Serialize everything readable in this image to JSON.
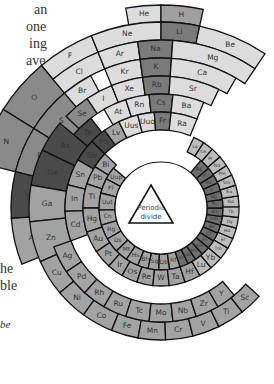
{
  "figure": {
    "center_label_line1": "Periodic",
    "center_label_line2": "divide",
    "center": {
      "x": 161,
      "y": 208
    },
    "colors": {
      "light": "#dcdcdc",
      "mid_light": "#c4c4c4",
      "mid": "#a3a3a3",
      "dark_mid": "#8a8a8a",
      "alkali": "#7a7a7a",
      "metalloid": "#4a4a4a",
      "actinide": "#6e6e6e",
      "lanthanide": "#bdbdbd",
      "hydrogen": "#a0a0a0",
      "stroke": "#111111"
    }
  },
  "side_text_fragments": [
    {
      "text": "an",
      "x": 34,
      "y": 1
    },
    {
      "text": "one",
      "x": 26,
      "y": 18
    },
    {
      "text": "ing",
      "x": 29,
      "y": 35
    },
    {
      "text": "ave",
      "x": 26,
      "y": 52
    },
    {
      "text": ". It",
      "x": 26,
      "y": 69
    },
    {
      "text": "he",
      "x": 0,
      "y": 260
    },
    {
      "text": "ble",
      "x": 0,
      "y": 277
    },
    {
      "text": "be",
      "x": 0,
      "y": 316,
      "italic": true
    }
  ],
  "rings": [
    {
      "name": "period-1",
      "r0": 186,
      "r1": 203,
      "cells": [
        {
          "sym": "He",
          "a0": -10,
          "a1": 0,
          "color": "light"
        },
        {
          "sym": "H",
          "a0": 0,
          "a1": 12,
          "color": "hydrogen"
        }
      ]
    },
    {
      "name": "period-2",
      "r0": 168,
      "r1": 186,
      "cells": [
        {
          "sym": "F",
          "a0": -40,
          "a1": -22,
          "color": "light"
        },
        {
          "sym": "Ne",
          "a0": -22,
          "a1": 0,
          "color": "light"
        },
        {
          "sym": "Li",
          "a0": 0,
          "a1": 12,
          "color": "alkali"
        },
        {
          "sym": "Be",
          "a0": 12,
          "a1": 34,
          "color": "light"
        }
      ]
    },
    {
      "name": "period-2-outer",
      "r0": 150,
      "r1": 186,
      "cells": [
        {
          "sym": "O",
          "a0": -58,
          "a1": -40,
          "color": "dark_mid"
        },
        {
          "sym": "N",
          "a0": -76,
          "a1": -58,
          "color": "dark_mid"
        }
      ]
    },
    {
      "name": "period-3",
      "r0": 150,
      "r1": 168,
      "cells": [
        {
          "sym": "Cl",
          "a0": -40,
          "a1": -22,
          "color": "light"
        },
        {
          "sym": "Ar",
          "a0": -22,
          "a1": -8,
          "color": "light"
        },
        {
          "sym": "Na",
          "a0": -8,
          "a1": 4,
          "color": "alkali"
        },
        {
          "sym": "Mg",
          "a0": 4,
          "a1": 34,
          "color": "light"
        }
      ]
    },
    {
      "name": "period-3-outer",
      "r0": 114,
      "r1": 150,
      "cells": [
        {
          "sym": "S",
          "a0": -58,
          "a1": -40,
          "color": "dark_mid"
        },
        {
          "sym": "P",
          "a0": -76,
          "a1": -58,
          "color": "dark_mid"
        },
        {
          "sym": "Si",
          "a0": -94,
          "a1": -76,
          "color": "metalloid"
        },
        {
          "sym": "Al",
          "a0": -112,
          "a1": -94,
          "color": "mid"
        }
      ]
    },
    {
      "name": "period-4",
      "r0": 132,
      "r1": 150,
      "cells": [
        {
          "sym": "Br",
          "a0": -40,
          "a1": -28,
          "color": "light"
        },
        {
          "sym": "Kr",
          "a0": -22,
          "a1": -8,
          "color": "light"
        },
        {
          "sym": "K",
          "a0": -8,
          "a1": 4,
          "color": "alkali"
        },
        {
          "sym": "Ca",
          "a0": 4,
          "a1": 30,
          "color": "light"
        }
      ]
    },
    {
      "name": "period-4-mid",
      "r0": 114,
      "r1": 132,
      "cells": [
        {
          "sym": "Se",
          "a0": -46,
          "a1": -34,
          "color": "dark_mid"
        },
        {
          "sym": "I",
          "a0": -34,
          "a1": -22,
          "color": "light"
        },
        {
          "sym": "Xe",
          "a0": -22,
          "a1": -8,
          "color": "light"
        },
        {
          "sym": "Rb",
          "a0": -8,
          "a1": 4,
          "color": "alkali"
        },
        {
          "sym": "Sr",
          "a0": 4,
          "a1": 26,
          "color": "light"
        }
      ]
    },
    {
      "name": "period-5",
      "r0": 96,
      "r1": 114,
      "cells": [
        {
          "sym": "Te",
          "a0": -50,
          "a1": -38,
          "color": "metalloid"
        },
        {
          "sym": "At",
          "a0": -30,
          "a1": -18,
          "color": "light"
        },
        {
          "sym": "Rn",
          "a0": -18,
          "a1": -6,
          "color": "light"
        },
        {
          "sym": "Cs",
          "a0": -6,
          "a1": 6,
          "color": "alkali"
        },
        {
          "sym": "Ba",
          "a0": 6,
          "a1": 22,
          "color": "light"
        }
      ]
    },
    {
      "name": "period-5-left",
      "r0": 96,
      "r1": 132,
      "cells": [
        {
          "sym": "As",
          "a0": -64,
          "a1": -50,
          "color": "metalloid"
        },
        {
          "sym": "Ge",
          "a0": -80,
          "a1": -64,
          "color": "metalloid"
        },
        {
          "sym": "Ga",
          "a0": -96,
          "a1": -80,
          "color": "mid"
        },
        {
          "sym": "Zn",
          "a0": -114,
          "a1": -96,
          "color": "mid"
        }
      ]
    },
    {
      "name": "period-6",
      "r0": 78,
      "r1": 96,
      "cells": [
        {
          "sym": "Sb",
          "a0": -60,
          "a1": -46,
          "color": "metalloid"
        },
        {
          "sym": "Po",
          "a0": -46,
          "a1": -36,
          "color": "metalloid"
        },
        {
          "sym": "Lv",
          "a0": -36,
          "a1": -26,
          "color": "mid"
        },
        {
          "sym": "Uus",
          "a0": -26,
          "a1": -14,
          "color": "light"
        },
        {
          "sym": "Uuo",
          "a0": -14,
          "a1": -4,
          "color": "light"
        },
        {
          "sym": "Fr",
          "a0": -4,
          "a1": 6,
          "color": "alkali"
        },
        {
          "sym": "Ra",
          "a0": 6,
          "a1": 22,
          "color": "light"
        }
      ]
    },
    {
      "name": "period-6-left",
      "r0": 78,
      "r1": 96,
      "cells": [
        {
          "sym": "Sn",
          "a0": -76,
          "a1": -60,
          "color": "mid"
        },
        {
          "sym": "In",
          "a0": -92,
          "a1": -76,
          "color": "mid"
        },
        {
          "sym": "Cd",
          "a0": -110,
          "a1": -92,
          "color": "mid"
        }
      ]
    },
    {
      "name": "inner-1",
      "r0": 62,
      "r1": 78,
      "cells": [
        {
          "sym": "Bi",
          "a0": -58,
          "a1": -46,
          "color": "mid"
        },
        {
          "sym": "Pb",
          "a0": -72,
          "a1": -58,
          "color": "mid"
        },
        {
          "sym": "Tl",
          "a0": -90,
          "a1": -72,
          "color": "mid"
        },
        {
          "sym": "Hg",
          "a0": -108,
          "a1": -90,
          "color": "mid"
        }
      ]
    },
    {
      "name": "inner-2",
      "r0": 46,
      "r1": 62,
      "cells": [
        {
          "sym": "Uup",
          "a0": -62,
          "a1": -50,
          "color": "mid"
        },
        {
          "sym": "Fl",
          "a0": -76,
          "a1": -62,
          "color": "mid"
        },
        {
          "sym": "Uut",
          "a0": -92,
          "a1": -76,
          "color": "mid"
        },
        {
          "sym": "Cn",
          "a0": -106,
          "a1": -92,
          "color": "mid"
        },
        {
          "sym": "Rg",
          "a0": -120,
          "a1": -106,
          "color": "mid"
        },
        {
          "sym": "Ds",
          "a0": -134,
          "a1": -120,
          "color": "mid"
        },
        {
          "sym": "Mt",
          "a0": -146,
          "a1": -134,
          "color": "mid"
        },
        {
          "sym": "Hs",
          "a0": -158,
          "a1": -146,
          "color": "mid"
        },
        {
          "sym": "Bh",
          "a0": -168,
          "a1": -158,
          "color": "mid"
        },
        {
          "sym": "Sg",
          "a0": -178,
          "a1": -168,
          "color": "mid"
        },
        {
          "sym": "Db",
          "a0": 172,
          "a1": 182,
          "color": "mid"
        },
        {
          "sym": "Rf",
          "a0": 162,
          "a1": 172,
          "color": "mid"
        },
        {
          "sym": "Lr",
          "a0": 154,
          "a1": 162,
          "color": "actinide"
        },
        {
          "sym": "No",
          "a0": 146,
          "a1": 154,
          "color": "actinide"
        },
        {
          "sym": "Md",
          "a0": 138,
          "a1": 146,
          "color": "actinide"
        },
        {
          "sym": "Fm",
          "a0": 130,
          "a1": 138,
          "color": "actinide"
        },
        {
          "sym": "Es",
          "a0": 122,
          "a1": 130,
          "color": "actinide"
        },
        {
          "sym": "Cf",
          "a0": 114,
          "a1": 122,
          "color": "actinide"
        },
        {
          "sym": "Bk",
          "a0": 106,
          "a1": 114,
          "color": "actinide"
        },
        {
          "sym": "Cm",
          "a0": 98,
          "a1": 106,
          "color": "actinide"
        },
        {
          "sym": "Am",
          "a0": 90,
          "a1": 98,
          "color": "actinide"
        },
        {
          "sym": "Pu",
          "a0": 82,
          "a1": 90,
          "color": "actinide"
        },
        {
          "sym": "Np",
          "a0": 74,
          "a1": 82,
          "color": "actinide"
        },
        {
          "sym": "U",
          "a0": 66,
          "a1": 74,
          "color": "actinide"
        },
        {
          "sym": "Pa",
          "a0": 58,
          "a1": 66,
          "color": "actinide"
        },
        {
          "sym": "Th",
          "a0": 50,
          "a1": 58,
          "color": "actinide"
        },
        {
          "sym": "Ac",
          "a0": 40,
          "a1": 50,
          "color": "actinide"
        }
      ]
    },
    {
      "name": "d-block-1",
      "r0": 62,
      "r1": 78,
      "cells": [
        {
          "sym": "Au",
          "a0": -124,
          "a1": -108,
          "color": "mid"
        },
        {
          "sym": "Pt",
          "a0": -138,
          "a1": -124,
          "color": "mid"
        },
        {
          "sym": "Ir",
          "a0": -150,
          "a1": -138,
          "color": "mid"
        },
        {
          "sym": "Os",
          "a0": -162,
          "a1": -150,
          "color": "mid"
        },
        {
          "sym": "Re",
          "a0": -174,
          "a1": -162,
          "color": "mid"
        },
        {
          "sym": "W",
          "a0": 174,
          "a1": 186,
          "color": "mid"
        },
        {
          "sym": "Ta",
          "a0": 162,
          "a1": 174,
          "color": "mid"
        },
        {
          "sym": "Hf",
          "a0": 150,
          "a1": 162,
          "color": "mid"
        },
        {
          "sym": "Lu",
          "a0": 140,
          "a1": 150,
          "color": "lanthanide"
        },
        {
          "sym": "Yb",
          "a0": 130,
          "a1": 140,
          "color": "lanthanide"
        },
        {
          "sym": "Tm",
          "a0": 121,
          "a1": 130,
          "color": "lanthanide"
        },
        {
          "sym": "Er",
          "a0": 113,
          "a1": 121,
          "color": "lanthanide"
        },
        {
          "sym": "Ho",
          "a0": 105,
          "a1": 113,
          "color": "lanthanide"
        },
        {
          "sym": "Dy",
          "a0": 97,
          "a1": 105,
          "color": "lanthanide"
        },
        {
          "sym": "Tb",
          "a0": 89,
          "a1": 97,
          "color": "lanthanide"
        },
        {
          "sym": "Gd",
          "a0": 81,
          "a1": 89,
          "color": "lanthanide"
        },
        {
          "sym": "Eu",
          "a0": 73,
          "a1": 81,
          "color": "lanthanide"
        },
        {
          "sym": "Sm",
          "a0": 65,
          "a1": 73,
          "color": "lanthanide"
        },
        {
          "sym": "Pm",
          "a0": 57,
          "a1": 65,
          "color": "lanthanide"
        },
        {
          "sym": "Nd",
          "a0": 49,
          "a1": 57,
          "color": "lanthanide"
        },
        {
          "sym": "Pr",
          "a0": 41,
          "a1": 49,
          "color": "lanthanide"
        },
        {
          "sym": "Ce",
          "a0": 33,
          "a1": 41,
          "color": "lanthanide"
        },
        {
          "sym": "La",
          "a0": 25,
          "a1": 33,
          "color": "lanthanide"
        }
      ]
    },
    {
      "name": "d-block-2",
      "r0": 114,
      "r1": 132,
      "cells": [
        {
          "sym": "Cu",
          "a0": -130,
          "a1": -114,
          "color": "mid"
        },
        {
          "sym": "Ni",
          "a0": -144,
          "a1": -130,
          "color": "mid"
        },
        {
          "sym": "Co",
          "a0": -158,
          "a1": -144,
          "color": "mid"
        },
        {
          "sym": "Fe",
          "a0": -170,
          "a1": -158,
          "color": "mid"
        },
        {
          "sym": "Mn",
          "a0": 178,
          "a1": 190,
          "color": "mid"
        },
        {
          "sym": "Cr",
          "a0": 166,
          "a1": 178,
          "color": "mid"
        },
        {
          "sym": "V",
          "a0": 154,
          "a1": 166,
          "color": "mid"
        },
        {
          "sym": "Ti",
          "a0": 142,
          "a1": 154,
          "color": "mid"
        },
        {
          "sym": "Sc",
          "a0": 132,
          "a1": 142,
          "color": "mid"
        }
      ]
    },
    {
      "name": "d-block-3",
      "r0": 96,
      "r1": 114,
      "cells": [
        {
          "sym": "Ag",
          "a0": -124,
          "a1": -110,
          "color": "mid"
        },
        {
          "sym": "Pd",
          "a0": -138,
          "a1": -124,
          "color": "mid"
        },
        {
          "sym": "Rh",
          "a0": -150,
          "a1": -138,
          "color": "mid"
        },
        {
          "sym": "Ru",
          "a0": -162,
          "a1": -150,
          "color": "mid"
        },
        {
          "sym": "Tc",
          "a0": -174,
          "a1": -162,
          "color": "mid"
        },
        {
          "sym": "Mo",
          "a0": 174,
          "a1": 186,
          "color": "mid"
        },
        {
          "sym": "Nb",
          "a0": 162,
          "a1": 174,
          "color": "mid"
        },
        {
          "sym": "Zr",
          "a0": 150,
          "a1": 162,
          "color": "mid"
        },
        {
          "sym": "Y",
          "a0": 140,
          "a1": 150,
          "color": "mid"
        }
      ]
    }
  ]
}
